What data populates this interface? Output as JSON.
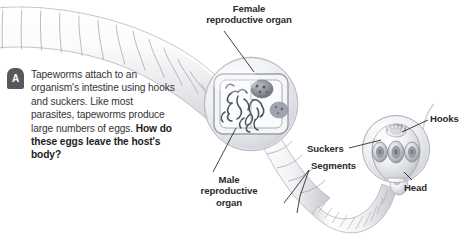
{
  "figure": {
    "background_color": "#ffffff",
    "label_color": "#2b2b2e",
    "body_color": "#333336",
    "badge_color": "#58595b"
  },
  "caption": {
    "badge_letter": "A",
    "text_plain": "Tapeworms attach to an organism's intestine using hooks and suckers. Like most parasites, tapeworms produce large numbers of eggs. ",
    "question_bold": "How do these eggs leave the host's body?"
  },
  "labels": {
    "female_organ": "Female\nreproductive organ",
    "female_organ_line1": "Female",
    "female_organ_line2": "reproductive organ",
    "male_organ_line1": "Male",
    "male_organ_line2": "reproductive",
    "male_organ_line3": "organ",
    "suckers": "Suckers",
    "segments": "Segments",
    "hooks": "Hooks",
    "head": "Head"
  },
  "illustration": {
    "organism": "tapeworm",
    "parts": [
      "segmented body",
      "proglottid magnification inset",
      "scolex head inset",
      "suckers",
      "hooks"
    ],
    "inset_female_center": [
      251,
      104
    ],
    "inset_female_radius": 46,
    "inset_head_center": [
      396,
      149
    ],
    "inset_head_radius": 33
  }
}
